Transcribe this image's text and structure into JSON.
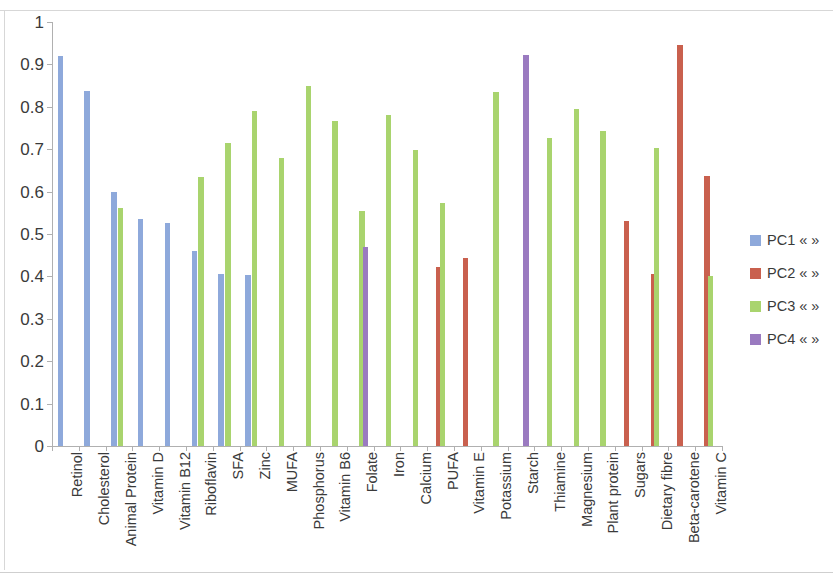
{
  "chart_data": {
    "type": "bar",
    "title": "",
    "subtitle": "",
    "xlabel": "",
    "ylabel": "",
    "ylim": [
      0,
      1
    ],
    "ytick_labels": [
      "0",
      "0.1",
      "0.2",
      "0.3",
      "0.4",
      "0.5",
      "0.6",
      "0.7",
      "0.8",
      "0.9",
      "1"
    ],
    "ytick_values": [
      0,
      0.1,
      0.2,
      0.3,
      0.4,
      0.5,
      0.6,
      0.7,
      0.8,
      0.9,
      1
    ],
    "grid": false,
    "legend_position": "right",
    "categories": [
      "Retinol",
      "Cholesterol",
      "Animal Protein",
      "Vitamin D",
      "Vitamin B12",
      "Riboflavin",
      "SFA",
      "Zinc",
      "MUFA",
      "Phosphorus",
      "Vitamin B6",
      "Folate",
      "Iron",
      "Calcium",
      "PUFA",
      "Vitamin E",
      "Potassium",
      "Starch",
      "Thiamine",
      "Magnesium",
      "Plant protein",
      "Sugars",
      "Dietary fibre",
      "Beta-carotene",
      "Vitamin C"
    ],
    "series": [
      {
        "name": "PC1 « »",
        "color": "#8EA9DB",
        "values": [
          0.92,
          0.838,
          0.598,
          0.535,
          0.527,
          0.459,
          0.405,
          0.404,
          null,
          null,
          null,
          null,
          null,
          null,
          null,
          null,
          null,
          null,
          null,
          null,
          null,
          null,
          null,
          null,
          null
        ]
      },
      {
        "name": "PC2 « »",
        "color": "#C9604E",
        "values": [
          null,
          null,
          null,
          null,
          null,
          null,
          null,
          null,
          null,
          null,
          null,
          null,
          null,
          null,
          0.423,
          0.443,
          null,
          null,
          null,
          null,
          null,
          0.53,
          0.405,
          0.945,
          0.638
        ]
      },
      {
        "name": "PC3 « »",
        "color": "#A9D46E",
        "values": [
          null,
          null,
          0.562,
          null,
          null,
          0.635,
          0.715,
          0.79,
          0.68,
          0.85,
          0.766,
          0.555,
          0.78,
          0.697,
          0.572,
          null,
          0.835,
          null,
          0.726,
          0.796,
          0.744,
          null,
          0.703,
          null,
          0.402
        ]
      },
      {
        "name": "PC4 « »",
        "color": "#9A7AC0",
        "values": [
          null,
          null,
          null,
          null,
          null,
          null,
          null,
          null,
          null,
          null,
          null,
          0.47,
          null,
          null,
          null,
          null,
          null,
          0.922,
          null,
          null,
          null,
          null,
          null,
          null,
          null
        ]
      }
    ]
  },
  "legend": {
    "entries": [
      {
        "label": "PC1 « »",
        "color": "#8EA9DB"
      },
      {
        "label": "PC2 « »",
        "color": "#C9604E"
      },
      {
        "label": "PC3 « »",
        "color": "#A9D46E"
      },
      {
        "label": "PC4 « »",
        "color": "#9A7AC0"
      }
    ]
  }
}
